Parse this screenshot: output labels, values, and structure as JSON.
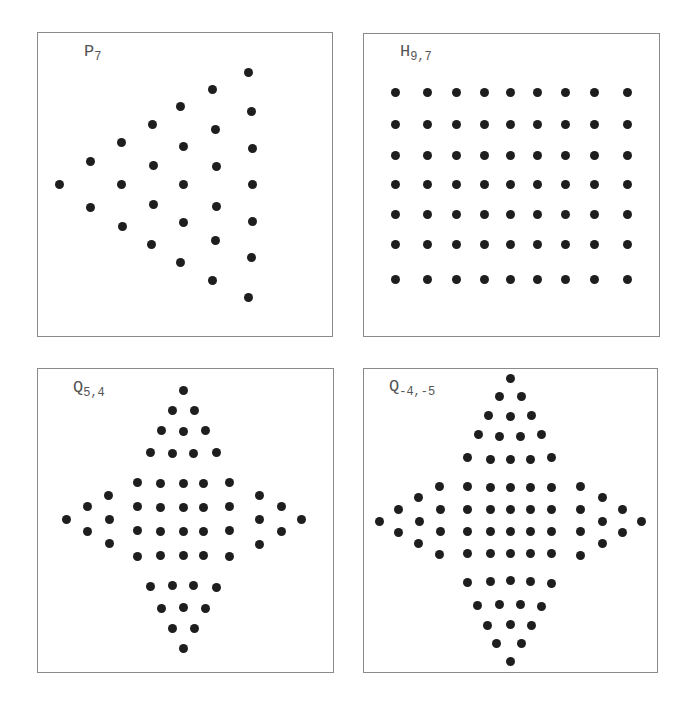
{
  "figure": {
    "panels": [
      {
        "id": "p7",
        "label_main": "P",
        "label_sub": "7",
        "box": {
          "x": 37,
          "y": 32,
          "w": 296,
          "h": 305
        },
        "label_pos": {
          "x": 84,
          "y": 54
        },
        "dots": [
          [
            59,
            184
          ],
          [
            90,
            161
          ],
          [
            90,
            207
          ],
          [
            121,
            142
          ],
          [
            121,
            184
          ],
          [
            122,
            226
          ],
          [
            152,
            124
          ],
          [
            153,
            165
          ],
          [
            153,
            204
          ],
          [
            151,
            244
          ],
          [
            180,
            106
          ],
          [
            183,
            146
          ],
          [
            183,
            184
          ],
          [
            183,
            222
          ],
          [
            180,
            262
          ],
          [
            212,
            89
          ],
          [
            215,
            129
          ],
          [
            216,
            166
          ],
          [
            216,
            206
          ],
          [
            215,
            240
          ],
          [
            212,
            280
          ],
          [
            248,
            72
          ],
          [
            251,
            111
          ],
          [
            252,
            148
          ],
          [
            252,
            184
          ],
          [
            252,
            221
          ],
          [
            251,
            257
          ],
          [
            248,
            297
          ]
        ]
      },
      {
        "id": "h97",
        "label_main": "H",
        "label_sub": "9,7",
        "box": {
          "x": 363,
          "y": 33,
          "w": 297,
          "h": 304
        },
        "label_pos": {
          "x": 400,
          "y": 54
        },
        "grid": {
          "cols_x": [
            395,
            427,
            456,
            484,
            510,
            537,
            565,
            594,
            627
          ],
          "rows_y": [
            92,
            124,
            155,
            184,
            214,
            244,
            279
          ]
        }
      },
      {
        "id": "q54",
        "label_main": "Q",
        "label_sub": "5,4",
        "box": {
          "x": 37,
          "y": 368,
          "w": 297,
          "h": 305
        },
        "label_pos": {
          "x": 73,
          "y": 390
        },
        "dots": [
          [
            183,
            390
          ],
          [
            172,
            410
          ],
          [
            194,
            410
          ],
          [
            161,
            430
          ],
          [
            183,
            431
          ],
          [
            205,
            430
          ],
          [
            150,
            452
          ],
          [
            172,
            453
          ],
          [
            193,
            453
          ],
          [
            216,
            452
          ],
          [
            137,
            482
          ],
          [
            160,
            483
          ],
          [
            183,
            483
          ],
          [
            203,
            483
          ],
          [
            229,
            482
          ],
          [
            137,
            506
          ],
          [
            160,
            507
          ],
          [
            183,
            507
          ],
          [
            203,
            507
          ],
          [
            229,
            506
          ],
          [
            137,
            530
          ],
          [
            160,
            531
          ],
          [
            183,
            531
          ],
          [
            203,
            531
          ],
          [
            229,
            530
          ],
          [
            137,
            556
          ],
          [
            160,
            555
          ],
          [
            183,
            555
          ],
          [
            203,
            555
          ],
          [
            229,
            556
          ],
          [
            150,
            586
          ],
          [
            172,
            585
          ],
          [
            193,
            585
          ],
          [
            216,
            587
          ],
          [
            161,
            608
          ],
          [
            183,
            607
          ],
          [
            205,
            608
          ],
          [
            172,
            628
          ],
          [
            194,
            628
          ],
          [
            183,
            648
          ],
          [
            108,
            495
          ],
          [
            87,
            506
          ],
          [
            109,
            519
          ],
          [
            66,
            519
          ],
          [
            87,
            531
          ],
          [
            109,
            543
          ],
          [
            259,
            495
          ],
          [
            281,
            506
          ],
          [
            259,
            519
          ],
          [
            301,
            519
          ],
          [
            281,
            531
          ],
          [
            259,
            544
          ]
        ]
      },
      {
        "id": "q-4-5",
        "label_main": "Q",
        "label_sub": "-4,-5",
        "box": {
          "x": 363,
          "y": 368,
          "w": 295,
          "h": 305
        },
        "label_pos": {
          "x": 389,
          "y": 389
        },
        "dots": [
          [
            510,
            378
          ],
          [
            499,
            396
          ],
          [
            521,
            396
          ],
          [
            488,
            415
          ],
          [
            510,
            416
          ],
          [
            531,
            415
          ],
          [
            478,
            434
          ],
          [
            499,
            436
          ],
          [
            520,
            436
          ],
          [
            541,
            434
          ],
          [
            467,
            457
          ],
          [
            490,
            459
          ],
          [
            510,
            459
          ],
          [
            530,
            459
          ],
          [
            551,
            457
          ],
          [
            467,
            486
          ],
          [
            490,
            487
          ],
          [
            510,
            487
          ],
          [
            530,
            487
          ],
          [
            551,
            487
          ],
          [
            467,
            509
          ],
          [
            490,
            509
          ],
          [
            510,
            509
          ],
          [
            530,
            509
          ],
          [
            551,
            509
          ],
          [
            467,
            531
          ],
          [
            490,
            531
          ],
          [
            510,
            531
          ],
          [
            530,
            531
          ],
          [
            551,
            531
          ],
          [
            467,
            553
          ],
          [
            490,
            553
          ],
          [
            510,
            553
          ],
          [
            530,
            553
          ],
          [
            551,
            553
          ],
          [
            467,
            582
          ],
          [
            490,
            581
          ],
          [
            510,
            580
          ],
          [
            530,
            581
          ],
          [
            551,
            583
          ],
          [
            477,
            605
          ],
          [
            499,
            604
          ],
          [
            520,
            604
          ],
          [
            541,
            606
          ],
          [
            487,
            625
          ],
          [
            510,
            624
          ],
          [
            531,
            625
          ],
          [
            496,
            643
          ],
          [
            521,
            643
          ],
          [
            510,
            661
          ],
          [
            439,
            486
          ],
          [
            418,
            497
          ],
          [
            440,
            509
          ],
          [
            398,
            509
          ],
          [
            419,
            521
          ],
          [
            440,
            531
          ],
          [
            418,
            543
          ],
          [
            398,
            532
          ],
          [
            379,
            521
          ],
          [
            439,
            554
          ],
          [
            580,
            486
          ],
          [
            602,
            497
          ],
          [
            580,
            509
          ],
          [
            622,
            509
          ],
          [
            602,
            521
          ],
          [
            580,
            531
          ],
          [
            602,
            543
          ],
          [
            622,
            532
          ],
          [
            641,
            521
          ],
          [
            580,
            555
          ]
        ]
      }
    ]
  }
}
